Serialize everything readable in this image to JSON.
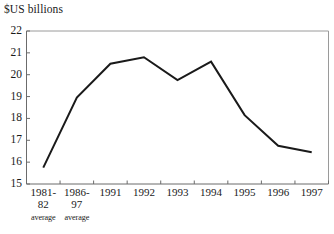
{
  "chart_data": {
    "type": "line",
    "title": "$US billions",
    "xlabel": "",
    "ylabel": "$US billions",
    "categories": [
      "1981-82 average",
      "1986-97 average",
      "1991",
      "1992",
      "1993",
      "1994",
      "1995",
      "1996",
      "1997"
    ],
    "category_parts": [
      {
        "line1": "1981-",
        "line2": "82",
        "sub": "average"
      },
      {
        "line1": "1986-",
        "line2": "97",
        "sub": "average"
      },
      {
        "line1": "1991",
        "line2": "",
        "sub": ""
      },
      {
        "line1": "1992",
        "line2": "",
        "sub": ""
      },
      {
        "line1": "1993",
        "line2": "",
        "sub": ""
      },
      {
        "line1": "1994",
        "line2": "",
        "sub": ""
      },
      {
        "line1": "1995",
        "line2": "",
        "sub": ""
      },
      {
        "line1": "1996",
        "line2": "",
        "sub": ""
      },
      {
        "line1": "1997",
        "line2": "",
        "sub": ""
      }
    ],
    "values": [
      15.75,
      18.95,
      20.5,
      20.8,
      19.75,
      20.6,
      18.15,
      16.75,
      16.45
    ],
    "ylim": [
      15,
      22
    ],
    "yticks": [
      22,
      21,
      20,
      19,
      18,
      17,
      16,
      15
    ],
    "ytick_labels": [
      "22",
      "21",
      "20",
      "19",
      "18",
      "17",
      "16",
      "15"
    ],
    "grid": false,
    "legend": null,
    "line_color": "#1a1a1a",
    "line_width": 2,
    "plot_border_color": "#9a9a9a",
    "axis_color": "#6b6b6b"
  }
}
